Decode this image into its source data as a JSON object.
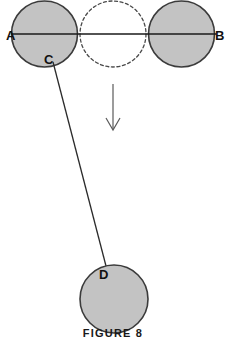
{
  "figure": {
    "caption": "FIGURE  8",
    "background_color": "#ffffff",
    "labels": {
      "a": "A",
      "b": "B",
      "c": "C",
      "d": "D"
    },
    "colors": {
      "sphere_fill": "#c3c3c3",
      "sphere_stroke": "#3b3b3b",
      "dashed_stroke": "#4a4a4a",
      "axis_line": "#1a1a1a",
      "connector_line": "#2b2b2b",
      "arrow": "#5a5a5a",
      "label_text": "#111111"
    },
    "elements": [
      {
        "name": "sphere-a",
        "kind": "filled-circle",
        "cx": 44.5,
        "cy": 34,
        "r": 33,
        "label": "A",
        "label_x": 6,
        "label_y": 39
      },
      {
        "name": "sphere-phantom",
        "kind": "dashed-circle",
        "cx": 113,
        "cy": 34,
        "r": 33,
        "label": "",
        "label_x": 0,
        "label_y": 0
      },
      {
        "name": "sphere-b",
        "kind": "filled-circle",
        "cx": 181.5,
        "cy": 34,
        "r": 33,
        "label": "B",
        "label_x": 215,
        "label_y": 39
      },
      {
        "name": "sphere-d",
        "kind": "filled-circle",
        "cx": 114,
        "cy": 299,
        "r": 34,
        "label": "D",
        "label_x": 99,
        "label_y": 278
      }
    ],
    "axis": {
      "name": "horizontal-axis-ab",
      "x1": 11,
      "y1": 34,
      "x2": 216,
      "y2": 34
    },
    "connector": {
      "name": "connector-c-to-d",
      "x1": 53,
      "y1": 62,
      "x2": 106,
      "y2": 266
    },
    "label_c": {
      "text": "C",
      "x": 43,
      "y": 63
    },
    "arrow": {
      "name": "downward-motion-arrow",
      "x": 113,
      "y_start": 84,
      "y_end": 129,
      "head_half_width": 7,
      "head_height": 11
    },
    "caption_pos": {
      "x": 113,
      "y": 336
    }
  }
}
